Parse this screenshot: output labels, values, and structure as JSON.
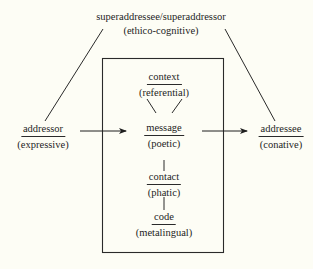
{
  "diagram": {
    "top": {
      "name": "superaddressee/superaddressor",
      "function": "(ethico-cognitive)"
    },
    "left": {
      "name": "addressor",
      "function": "(expressive)"
    },
    "right": {
      "name": "addressee",
      "function": "(conative)"
    },
    "box": {
      "context": {
        "name": "context",
        "function": "(referential)"
      },
      "message": {
        "name": "message",
        "function": "(poetic)"
      },
      "contact": {
        "name": "contact",
        "function": "(phatic)"
      },
      "code": {
        "name": "code",
        "function": "(metalingual)"
      }
    },
    "colors": {
      "background": "#fdfdf5",
      "ink": "#1e1e1e"
    }
  }
}
